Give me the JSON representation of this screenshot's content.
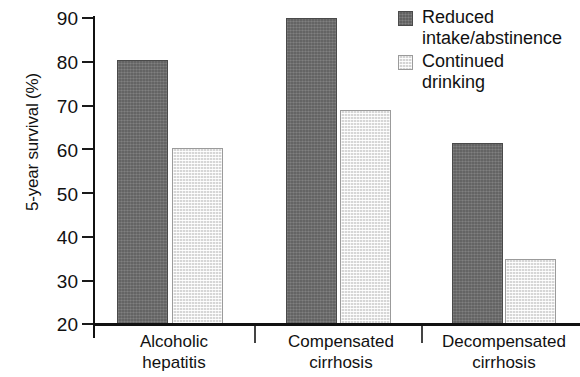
{
  "chart_data": {
    "type": "bar",
    "title": "",
    "subtitle": "",
    "xlabel": "",
    "ylabel": "5-year survival (%)",
    "ylim": [
      20,
      90
    ],
    "ytick_step": 10,
    "yticks": [
      90,
      80,
      70,
      60,
      50,
      40,
      30,
      20
    ],
    "ytick_labels": [
      "90",
      "80",
      "70",
      "60",
      "50",
      "40",
      "30",
      "20"
    ],
    "grid": false,
    "legend_position": "top-right",
    "categories": [
      "Alcoholic hepatitis",
      "Compensated cirrhosis",
      "Decompensated cirrhosis"
    ],
    "category_lines": [
      [
        "Alcoholic",
        "hepatitis"
      ],
      [
        "Compensated",
        "cirrhosis"
      ],
      [
        "Decompensated",
        "cirrhosis"
      ]
    ],
    "series": [
      {
        "name": "Reduced intake/abstinence",
        "name_lines": [
          "Reduced",
          "intake/abstinence"
        ],
        "color": "#6d6d6d",
        "values": [
          80,
          89.5,
          61
        ]
      },
      {
        "name": "Continued drinking",
        "name_lines": [
          "Continued",
          "drinking"
        ],
        "color": "#e9e9e9",
        "values": [
          60,
          68.5,
          34.5
        ]
      }
    ],
    "annotations": []
  },
  "legend": {
    "items": [
      {
        "label_line1": "Reduced",
        "label_line2": "intake/abstinence",
        "swatch": "dark-gray-swatch"
      },
      {
        "label_line1": "Continued",
        "label_line2": "drinking",
        "swatch": "light-gray-swatch"
      }
    ]
  },
  "axis": {
    "y_title": "5-year survival (%)",
    "y_labels": [
      "90",
      "80",
      "70",
      "60",
      "50",
      "40",
      "30",
      "20"
    ],
    "x_groups": [
      {
        "line1": "Alcoholic",
        "line2": "hepatitis"
      },
      {
        "line1": "Compensated",
        "line2": "cirrhosis"
      },
      {
        "line1": "Decompensated",
        "line2": "cirrhosis"
      }
    ]
  },
  "colors": {
    "series_dark": "#6d6d6d",
    "series_light": "#e9e9e9",
    "axis": "#111111",
    "text": "#1a1a1a",
    "background": "#ffffff"
  }
}
